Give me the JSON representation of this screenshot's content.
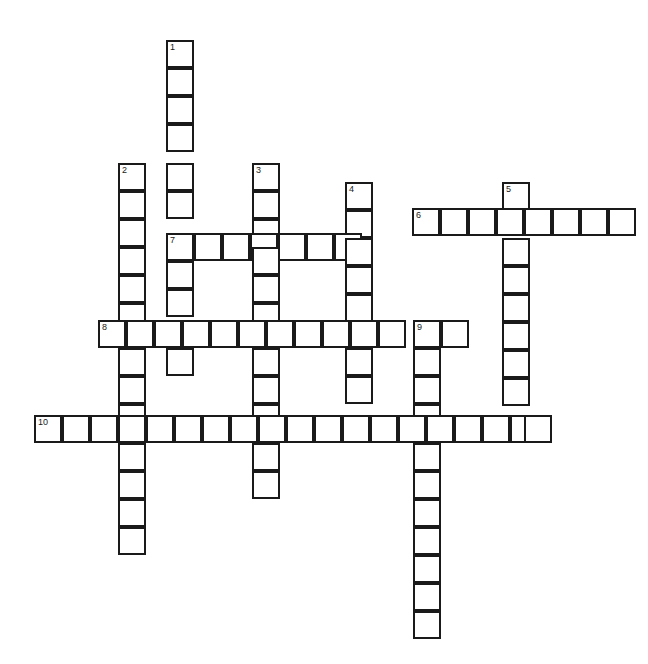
{
  "puzzle": {
    "type": "crossword-grid",
    "title": "Crossword Puzzle Grid",
    "state": "empty",
    "cell_size_px": 28,
    "grid_columns": 20,
    "grid_rows": 22,
    "colors": {
      "cell_fill": "#ffffff",
      "cell_border": "#1a1a1a",
      "number_text": "#1a1a1a",
      "background": "#ffffff"
    },
    "clue_numbers": [
      "1",
      "2",
      "3",
      "4",
      "5",
      "6",
      "7",
      "8",
      "9",
      "10"
    ],
    "entries": [
      {
        "number": "1",
        "direction": "down",
        "length": 13,
        "start_col": 5,
        "start_row": 0
      },
      {
        "number": "2",
        "direction": "down",
        "length": 14,
        "start_col": 3,
        "start_row": 4
      },
      {
        "number": "3",
        "direction": "down",
        "length": 12,
        "start_col": 8,
        "start_row": 4
      },
      {
        "number": "4",
        "direction": "down",
        "length": 8,
        "start_col": 11,
        "start_row": 5
      },
      {
        "number": "5",
        "direction": "down",
        "length": 9,
        "start_col": 17,
        "start_row": 5
      },
      {
        "number": "6",
        "direction": "across",
        "length": 8,
        "start_col": 14,
        "start_row": 6
      },
      {
        "number": "7",
        "direction": "across",
        "length": 7,
        "start_col": 5,
        "start_row": 7
      },
      {
        "number": "8",
        "direction": "across",
        "length": 13,
        "start_col": 2,
        "start_row": 10
      },
      {
        "number": "9",
        "direction": "down",
        "length": 12,
        "start_col": 14,
        "start_row": 10
      },
      {
        "number": "10",
        "direction": "across",
        "length": 19,
        "start_col": 0,
        "start_row": 13
      }
    ],
    "cells": [
      {
        "x": 166,
        "y": 40,
        "num": "1"
      },
      {
        "x": 166,
        "y": 68,
        "num": ""
      },
      {
        "x": 166,
        "y": 96,
        "num": ""
      },
      {
        "x": 166,
        "y": 124,
        "num": ""
      },
      {
        "x": 118,
        "y": 163,
        "num": "2"
      },
      {
        "x": 166,
        "y": 163,
        "num": ""
      },
      {
        "x": 252,
        "y": 163,
        "num": "3"
      },
      {
        "x": 118,
        "y": 191,
        "num": ""
      },
      {
        "x": 166,
        "y": 191,
        "num": ""
      },
      {
        "x": 252,
        "y": 191,
        "num": ""
      },
      {
        "x": 345,
        "y": 182,
        "num": "4"
      },
      {
        "x": 502,
        "y": 182,
        "num": "5"
      },
      {
        "x": 412,
        "y": 208,
        "num": "6"
      },
      {
        "x": 440,
        "y": 208,
        "num": ""
      },
      {
        "x": 468,
        "y": 208,
        "num": ""
      },
      {
        "x": 496,
        "y": 208,
        "num": ""
      },
      {
        "x": 524,
        "y": 208,
        "num": ""
      },
      {
        "x": 552,
        "y": 208,
        "num": ""
      },
      {
        "x": 580,
        "y": 208,
        "num": ""
      },
      {
        "x": 608,
        "y": 208,
        "num": ""
      },
      {
        "x": 118,
        "y": 219,
        "num": ""
      },
      {
        "x": 345,
        "y": 210,
        "num": ""
      },
      {
        "x": 252,
        "y": 219,
        "num": ""
      },
      {
        "x": 166,
        "y": 233,
        "num": "7"
      },
      {
        "x": 194,
        "y": 233,
        "num": ""
      },
      {
        "x": 222,
        "y": 233,
        "num": ""
      },
      {
        "x": 250,
        "y": 233,
        "num": ""
      },
      {
        "x": 278,
        "y": 233,
        "num": ""
      },
      {
        "x": 306,
        "y": 233,
        "num": ""
      },
      {
        "x": 334,
        "y": 233,
        "num": ""
      },
      {
        "x": 118,
        "y": 247,
        "num": ""
      },
      {
        "x": 166,
        "y": 261,
        "num": ""
      },
      {
        "x": 252,
        "y": 247,
        "num": ""
      },
      {
        "x": 345,
        "y": 238,
        "num": ""
      },
      {
        "x": 502,
        "y": 238,
        "num": ""
      },
      {
        "x": 118,
        "y": 275,
        "num": ""
      },
      {
        "x": 166,
        "y": 289,
        "num": ""
      },
      {
        "x": 252,
        "y": 275,
        "num": ""
      },
      {
        "x": 345,
        "y": 266,
        "num": ""
      },
      {
        "x": 502,
        "y": 266,
        "num": ""
      },
      {
        "x": 118,
        "y": 303,
        "num": ""
      },
      {
        "x": 252,
        "y": 303,
        "num": ""
      },
      {
        "x": 345,
        "y": 294,
        "num": ""
      },
      {
        "x": 502,
        "y": 294,
        "num": ""
      },
      {
        "x": 98,
        "y": 320,
        "num": "8"
      },
      {
        "x": 126,
        "y": 320,
        "num": ""
      },
      {
        "x": 154,
        "y": 320,
        "num": ""
      },
      {
        "x": 182,
        "y": 320,
        "num": ""
      },
      {
        "x": 210,
        "y": 320,
        "num": ""
      },
      {
        "x": 238,
        "y": 320,
        "num": ""
      },
      {
        "x": 266,
        "y": 320,
        "num": ""
      },
      {
        "x": 294,
        "y": 320,
        "num": ""
      },
      {
        "x": 322,
        "y": 320,
        "num": ""
      },
      {
        "x": 350,
        "y": 320,
        "num": ""
      },
      {
        "x": 378,
        "y": 320,
        "num": ""
      },
      {
        "x": 413,
        "y": 320,
        "num": "9"
      },
      {
        "x": 441,
        "y": 320,
        "num": ""
      },
      {
        "x": 118,
        "y": 348,
        "num": ""
      },
      {
        "x": 166,
        "y": 348,
        "num": ""
      },
      {
        "x": 252,
        "y": 348,
        "num": ""
      },
      {
        "x": 345,
        "y": 348,
        "num": ""
      },
      {
        "x": 413,
        "y": 348,
        "num": ""
      },
      {
        "x": 502,
        "y": 322,
        "num": ""
      },
      {
        "x": 118,
        "y": 376,
        "num": ""
      },
      {
        "x": 252,
        "y": 376,
        "num": ""
      },
      {
        "x": 345,
        "y": 376,
        "num": ""
      },
      {
        "x": 413,
        "y": 376,
        "num": ""
      },
      {
        "x": 502,
        "y": 350,
        "num": ""
      },
      {
        "x": 118,
        "y": 404,
        "num": ""
      },
      {
        "x": 252,
        "y": 404,
        "num": ""
      },
      {
        "x": 413,
        "y": 404,
        "num": ""
      },
      {
        "x": 502,
        "y": 378,
        "num": ""
      },
      {
        "x": 34,
        "y": 415,
        "num": "10"
      },
      {
        "x": 62,
        "y": 415,
        "num": ""
      },
      {
        "x": 90,
        "y": 415,
        "num": ""
      },
      {
        "x": 118,
        "y": 415,
        "num": ""
      },
      {
        "x": 146,
        "y": 415,
        "num": ""
      },
      {
        "x": 174,
        "y": 415,
        "num": ""
      },
      {
        "x": 202,
        "y": 415,
        "num": ""
      },
      {
        "x": 230,
        "y": 415,
        "num": ""
      },
      {
        "x": 258,
        "y": 415,
        "num": ""
      },
      {
        "x": 286,
        "y": 415,
        "num": ""
      },
      {
        "x": 314,
        "y": 415,
        "num": ""
      },
      {
        "x": 342,
        "y": 415,
        "num": ""
      },
      {
        "x": 370,
        "y": 415,
        "num": ""
      },
      {
        "x": 398,
        "y": 415,
        "num": ""
      },
      {
        "x": 426,
        "y": 415,
        "num": ""
      },
      {
        "x": 454,
        "y": 415,
        "num": ""
      },
      {
        "x": 482,
        "y": 415,
        "num": ""
      },
      {
        "x": 510,
        "y": 415,
        "num": ""
      },
      {
        "x": 524,
        "y": 415,
        "num": ""
      },
      {
        "x": 118,
        "y": 443,
        "num": ""
      },
      {
        "x": 252,
        "y": 443,
        "num": ""
      },
      {
        "x": 413,
        "y": 443,
        "num": ""
      },
      {
        "x": 118,
        "y": 471,
        "num": ""
      },
      {
        "x": 252,
        "y": 471,
        "num": ""
      },
      {
        "x": 413,
        "y": 471,
        "num": ""
      },
      {
        "x": 118,
        "y": 499,
        "num": ""
      },
      {
        "x": 413,
        "y": 499,
        "num": ""
      },
      {
        "x": 118,
        "y": 527,
        "num": ""
      },
      {
        "x": 413,
        "y": 527,
        "num": ""
      },
      {
        "x": 413,
        "y": 555,
        "num": ""
      },
      {
        "x": 413,
        "y": 583,
        "num": ""
      },
      {
        "x": 413,
        "y": 611,
        "num": ""
      }
    ]
  }
}
